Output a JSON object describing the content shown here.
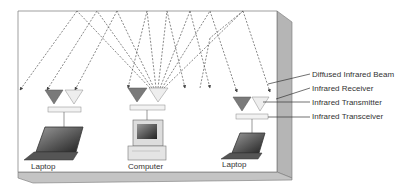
{
  "diagram": {
    "devices": [
      {
        "id": "laptop-left",
        "label": "Laptop",
        "type": "laptop"
      },
      {
        "id": "computer",
        "label": "Computer",
        "type": "desktop"
      },
      {
        "id": "laptop-right",
        "label": "Laptop",
        "type": "laptop"
      }
    ],
    "callouts": [
      {
        "id": "beam",
        "label": "Diffused Infrared Beam"
      },
      {
        "id": "receiver",
        "label": "Infrared Receiver"
      },
      {
        "id": "transmitter",
        "label": "Infrared Transmitter"
      },
      {
        "id": "transceiver",
        "label": "Infrared Transceiver"
      }
    ],
    "colors": {
      "wall_fill": "#ffffff",
      "wall_edge": "#777777",
      "side_wall": "#b8b8b8",
      "floor": "#c8c8c8",
      "receiver": "#7a7a7a",
      "transmitter": "#ececec",
      "transceiver_bar": "#f0f0f0",
      "beam": "#555555"
    }
  }
}
